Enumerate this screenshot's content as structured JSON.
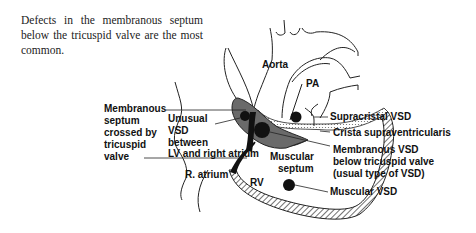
{
  "caption": "Defects in the membranous septum below the tricuspid valve are the most common.",
  "diagram": {
    "labels": {
      "aorta": "Aorta",
      "pa": "PA",
      "membranous_septum": [
        "Membranous",
        "septum",
        "crossed by",
        "tricuspid",
        "valve"
      ],
      "unusual_vsd": [
        "Unusual",
        "VSD",
        "between",
        "LV and right atrium"
      ],
      "r_atrium": "R. atrium",
      "rv": "RV",
      "muscular_septum": [
        "Muscular",
        "septum"
      ],
      "supracristal_vsd": "Supracristal VSD",
      "crista": "Crista supraventricularis",
      "membranous_vsd": [
        "Membranous VSD",
        "below tricuspid valve",
        "(usual type of VSD)"
      ],
      "muscular_vsd": "Muscular VSD"
    }
  }
}
